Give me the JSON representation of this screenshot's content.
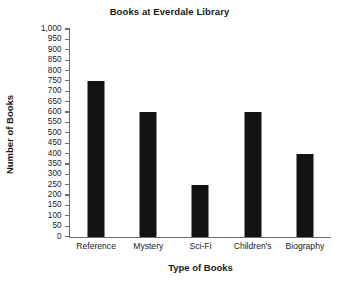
{
  "chart_data": {
    "type": "bar",
    "title": "Books at Everdale Library",
    "xlabel": "Type of Books",
    "ylabel": "Number of Books",
    "categories": [
      "Reference",
      "Mystery",
      "Sci-Fi",
      "Children's",
      "Biography"
    ],
    "values": [
      750,
      600,
      250,
      600,
      400
    ],
    "ylim": [
      0,
      1000
    ],
    "ytick_step": 50,
    "ytick_labels": [
      "0",
      "50",
      "100",
      "150",
      "200",
      "250",
      "300",
      "350",
      "400",
      "450",
      "500",
      "550",
      "600",
      "650",
      "700",
      "750",
      "800",
      "850",
      "900",
      "950",
      "1,000"
    ],
    "grid": false,
    "legend": false,
    "bar_color": "#131313",
    "axis_color": "#6d6d6d",
    "background_color": "#ffffff"
  }
}
